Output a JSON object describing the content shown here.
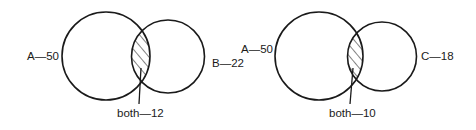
{
  "diagrams": [
    {
      "id": "venn-a-b",
      "sets": [
        {
          "name": "A",
          "count": 50,
          "label": "A—50"
        },
        {
          "name": "B",
          "count": 22,
          "label": "B—22"
        }
      ],
      "intersection": {
        "name": "both",
        "count": 12,
        "label": "both—12"
      }
    },
    {
      "id": "venn-a-c",
      "sets": [
        {
          "name": "A",
          "count": 50,
          "label": "A—50"
        },
        {
          "name": "C",
          "count": 18,
          "label": "C—18"
        }
      ],
      "intersection": {
        "name": "both",
        "count": 10,
        "label": "both—10"
      }
    }
  ],
  "colors": {
    "stroke": "#1a1a1a",
    "background": "#ffffff",
    "hatch": "#1a1a1a"
  },
  "icons": {
    "intersection_fill": "diagonal-hatch-pattern"
  }
}
